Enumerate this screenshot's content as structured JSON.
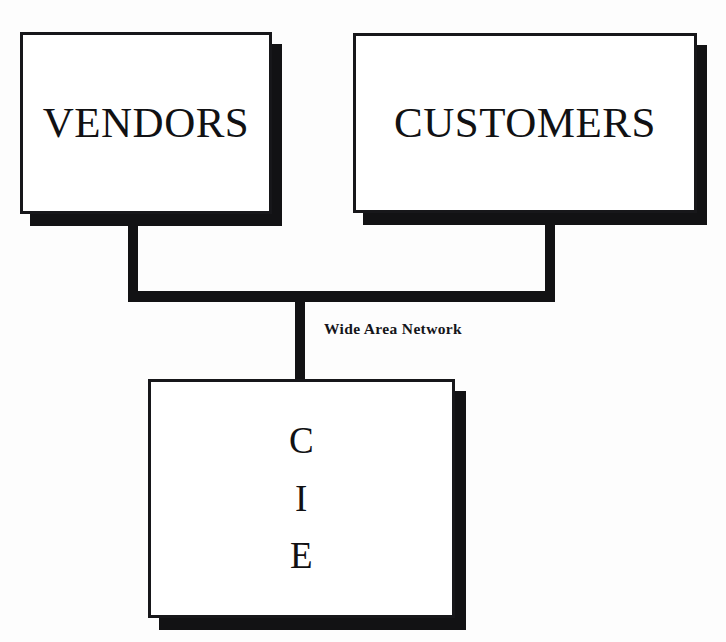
{
  "diagram": {
    "type": "network-topology",
    "background_color": "#fdfdfd",
    "stroke_color": "#121214",
    "node_fill_color": "#ffffff",
    "nodes": [
      {
        "id": "vendors",
        "label": "VENDORS",
        "shape": "rectangle-with-drop-shadow"
      },
      {
        "id": "customers",
        "label": "CUSTOMERS",
        "shape": "rectangle-with-drop-shadow"
      },
      {
        "id": "cie",
        "label": "C\nI\nE",
        "shape": "rectangle-with-drop-shadow"
      }
    ],
    "connections": {
      "bus_label": "Wide Area Network",
      "edges": [
        {
          "from": "vendors",
          "to": "wide-area-network"
        },
        {
          "from": "customers",
          "to": "wide-area-network"
        },
        {
          "from": "wide-area-network",
          "to": "cie"
        }
      ]
    }
  }
}
